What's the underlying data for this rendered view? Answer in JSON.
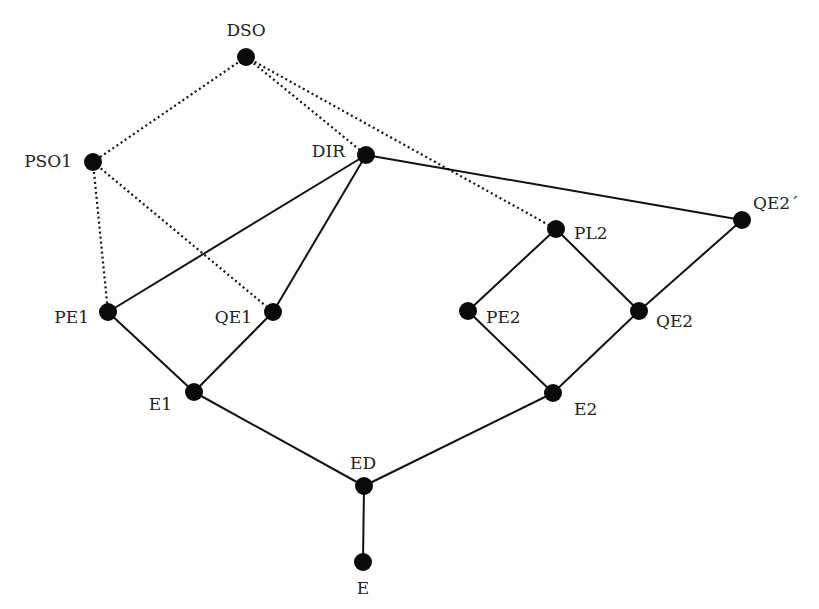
{
  "diagram": {
    "type": "lattice-graph",
    "colors": {
      "node": "#0a0a0a",
      "edge": "#111111",
      "label": "#222222",
      "background": "#ffffff"
    },
    "nodes": [
      {
        "id": "DSO",
        "label": "DSO",
        "x": 246,
        "y": 57,
        "lx": 246,
        "ly": 31,
        "anchor": "middle"
      },
      {
        "id": "PSO1",
        "label": "PSO1",
        "x": 93,
        "y": 162,
        "lx": 72,
        "ly": 162,
        "anchor": "end"
      },
      {
        "id": "DIR",
        "label": "DIR",
        "x": 366,
        "y": 155,
        "lx": 345,
        "ly": 152,
        "anchor": "end"
      },
      {
        "id": "PL2",
        "label": "PL2",
        "x": 556,
        "y": 229,
        "lx": 574,
        "ly": 234,
        "anchor": "start"
      },
      {
        "id": "QE2p",
        "label": "QE2´",
        "x": 742,
        "y": 220,
        "lx": 753,
        "ly": 204,
        "anchor": "start"
      },
      {
        "id": "PE1",
        "label": "PE1",
        "x": 108,
        "y": 312,
        "lx": 89,
        "ly": 318,
        "anchor": "end"
      },
      {
        "id": "QE1",
        "label": "QE1",
        "x": 273,
        "y": 312,
        "lx": 252,
        "ly": 318,
        "anchor": "end"
      },
      {
        "id": "PE2",
        "label": "PE2",
        "x": 468,
        "y": 311,
        "lx": 486,
        "ly": 318,
        "anchor": "start"
      },
      {
        "id": "QE2",
        "label": "QE2",
        "x": 639,
        "y": 311,
        "lx": 656,
        "ly": 322,
        "anchor": "start"
      },
      {
        "id": "E1",
        "label": "E1",
        "x": 194,
        "y": 392,
        "lx": 172,
        "ly": 405,
        "anchor": "end"
      },
      {
        "id": "E2",
        "label": "E2",
        "x": 553,
        "y": 393,
        "lx": 574,
        "ly": 410,
        "anchor": "start"
      },
      {
        "id": "ED",
        "label": "ED",
        "x": 364,
        "y": 486,
        "lx": 363,
        "ly": 464,
        "anchor": "middle"
      },
      {
        "id": "E",
        "label": "E",
        "x": 363,
        "y": 562,
        "lx": 363,
        "ly": 589,
        "anchor": "middle"
      }
    ],
    "edges": [
      {
        "from": "DSO",
        "to": "PSO1",
        "style": "dotted"
      },
      {
        "from": "DSO",
        "to": "DIR",
        "style": "dotted"
      },
      {
        "from": "DSO",
        "to": "PL2",
        "style": "dotted"
      },
      {
        "from": "PSO1",
        "to": "PE1",
        "style": "dotted"
      },
      {
        "from": "PSO1",
        "to": "QE1",
        "style": "dotted"
      },
      {
        "from": "DIR",
        "to": "PE1",
        "style": "solid"
      },
      {
        "from": "DIR",
        "to": "QE1",
        "style": "solid"
      },
      {
        "from": "DIR",
        "to": "QE2p",
        "style": "solid"
      },
      {
        "from": "PL2",
        "to": "PE2",
        "style": "solid"
      },
      {
        "from": "PL2",
        "to": "QE2",
        "style": "solid"
      },
      {
        "from": "QE2p",
        "to": "QE2",
        "style": "solid"
      },
      {
        "from": "PE1",
        "to": "E1",
        "style": "solid"
      },
      {
        "from": "QE1",
        "to": "E1",
        "style": "solid"
      },
      {
        "from": "PE2",
        "to": "E2",
        "style": "solid"
      },
      {
        "from": "QE2",
        "to": "E2",
        "style": "solid"
      },
      {
        "from": "E1",
        "to": "ED",
        "style": "solid"
      },
      {
        "from": "E2",
        "to": "ED",
        "style": "solid"
      },
      {
        "from": "ED",
        "to": "E",
        "style": "solid"
      }
    ]
  }
}
